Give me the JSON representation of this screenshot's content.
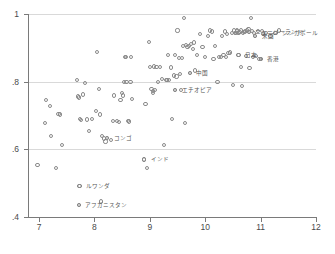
{
  "chart_data": {
    "type": "scatter",
    "title": "",
    "subtitle": "",
    "xlabel": "",
    "ylabel": "",
    "xlim": [
      6.8,
      12.0
    ],
    "ylim": [
      0.4,
      1.0
    ],
    "grid": true,
    "gridlines_y": [
      0.4,
      0.6,
      0.8,
      1.0
    ],
    "legend": "none",
    "marker": "open-circle",
    "marker_color": "#8a8a8a",
    "x_ticks": [
      "7",
      "8",
      "9",
      "10",
      "11",
      "12"
    ],
    "x_tick_values": [
      7,
      8,
      9,
      10,
      11,
      12
    ],
    "y_ticks": [
      "1",
      ".8",
      ".6",
      ".4"
    ],
    "y_tick_values": [
      1.0,
      0.8,
      0.6,
      0.4
    ],
    "labeled_points": [
      {
        "label": "シンガポール",
        "x": 11.27,
        "y": 0.945,
        "anchor": "right"
      },
      {
        "label": "米国",
        "x": 10.9,
        "y": 0.935,
        "anchor": "right"
      },
      {
        "label": "ニュージーランド",
        "x": 10.79,
        "y": 0.946,
        "anchor": "right"
      },
      {
        "label": "日本",
        "x": 10.6,
        "y": 0.88,
        "anchor": "right"
      },
      {
        "label": "香港",
        "x": 11.0,
        "y": 0.866,
        "anchor": "right"
      },
      {
        "label": "中国",
        "x": 9.72,
        "y": 0.826,
        "anchor": "right"
      },
      {
        "label": "エチオピア",
        "x": 9.46,
        "y": 0.776,
        "anchor": "right"
      },
      {
        "label": "コンゴ",
        "x": 8.23,
        "y": 0.633,
        "anchor": "right"
      },
      {
        "label": "インド",
        "x": 8.9,
        "y": 0.57,
        "anchor": "right"
      },
      {
        "label": "ルワンダ",
        "x": 7.73,
        "y": 0.492,
        "anchor": "right"
      },
      {
        "label": "アフガニスタン",
        "x": 7.72,
        "y": 0.436,
        "anchor": "right"
      }
    ],
    "points": [
      [
        6.97,
        0.553
      ],
      [
        7.1,
        0.678
      ],
      [
        7.12,
        0.745
      ],
      [
        7.2,
        0.728
      ],
      [
        7.22,
        0.639
      ],
      [
        7.3,
        0.545
      ],
      [
        7.35,
        0.705
      ],
      [
        7.38,
        0.703
      ],
      [
        7.41,
        0.612
      ],
      [
        7.68,
        0.806
      ],
      [
        7.7,
        0.756
      ],
      [
        7.72,
        0.753
      ],
      [
        7.73,
        0.492
      ],
      [
        7.72,
        0.436
      ],
      [
        7.74,
        0.69
      ],
      [
        7.76,
        0.686
      ],
      [
        7.8,
        0.762
      ],
      [
        7.83,
        0.795
      ],
      [
        7.86,
        0.688
      ],
      [
        7.9,
        0.655
      ],
      [
        7.95,
        0.69
      ],
      [
        8.03,
        0.713
      ],
      [
        8.05,
        0.888
      ],
      [
        8.08,
        0.778
      ],
      [
        8.1,
        0.703
      ],
      [
        8.12,
        0.446
      ],
      [
        8.14,
        0.64
      ],
      [
        8.17,
        0.632
      ],
      [
        8.2,
        0.623
      ],
      [
        8.23,
        0.633
      ],
      [
        8.3,
        0.627
      ],
      [
        8.33,
        0.684
      ],
      [
        8.36,
        0.759
      ],
      [
        8.4,
        0.683
      ],
      [
        8.44,
        0.68
      ],
      [
        8.47,
        0.746
      ],
      [
        8.49,
        0.766
      ],
      [
        8.52,
        0.759
      ],
      [
        8.54,
        0.8
      ],
      [
        8.55,
        0.872
      ],
      [
        8.57,
        0.872
      ],
      [
        8.58,
        0.799
      ],
      [
        8.6,
        0.684
      ],
      [
        8.63,
        0.682
      ],
      [
        8.65,
        0.8
      ],
      [
        8.66,
        0.874
      ],
      [
        8.68,
        0.749
      ],
      [
        8.9,
        0.57
      ],
      [
        8.92,
        0.733
      ],
      [
        8.95,
        0.545
      ],
      [
        8.98,
        0.918
      ],
      [
        9.0,
        0.843
      ],
      [
        9.03,
        0.778
      ],
      [
        9.05,
        0.766
      ],
      [
        9.06,
        0.773
      ],
      [
        9.08,
        0.845
      ],
      [
        9.1,
        0.776
      ],
      [
        9.12,
        0.844
      ],
      [
        9.15,
        0.8
      ],
      [
        9.18,
        0.843
      ],
      [
        9.22,
        0.808
      ],
      [
        9.26,
        0.612
      ],
      [
        9.3,
        0.805
      ],
      [
        9.31,
        0.806
      ],
      [
        9.33,
        0.88
      ],
      [
        9.35,
        0.804
      ],
      [
        9.38,
        0.842
      ],
      [
        9.4,
        0.69
      ],
      [
        9.43,
        0.818
      ],
      [
        9.45,
        0.88
      ],
      [
        9.46,
        0.776
      ],
      [
        9.48,
        0.815
      ],
      [
        9.5,
        0.951
      ],
      [
        9.52,
        0.871
      ],
      [
        9.54,
        0.823
      ],
      [
        9.56,
        0.776
      ],
      [
        9.58,
        0.87
      ],
      [
        9.6,
        0.905
      ],
      [
        9.62,
        0.988
      ],
      [
        9.64,
        0.678
      ],
      [
        9.66,
        0.908
      ],
      [
        9.68,
        0.903
      ],
      [
        9.7,
        0.905
      ],
      [
        9.72,
        0.826
      ],
      [
        9.75,
        0.912
      ],
      [
        9.78,
        0.896
      ],
      [
        9.8,
        0.916
      ],
      [
        9.82,
        0.833
      ],
      [
        9.85,
        0.878
      ],
      [
        9.9,
        0.942
      ],
      [
        9.95,
        0.903
      ],
      [
        10.0,
        0.873
      ],
      [
        10.05,
        0.936
      ],
      [
        10.08,
        0.951
      ],
      [
        10.12,
        0.948
      ],
      [
        10.15,
        0.866
      ],
      [
        10.18,
        0.905
      ],
      [
        10.22,
        0.798
      ],
      [
        10.25,
        0.873
      ],
      [
        10.28,
        0.873
      ],
      [
        10.3,
        0.936
      ],
      [
        10.33,
        0.88
      ],
      [
        10.35,
        0.948
      ],
      [
        10.38,
        0.873
      ],
      [
        10.4,
        0.941
      ],
      [
        10.42,
        0.885
      ],
      [
        10.45,
        0.886
      ],
      [
        10.48,
        0.944
      ],
      [
        10.5,
        0.79
      ],
      [
        10.52,
        0.951
      ],
      [
        10.54,
        0.945
      ],
      [
        10.56,
        0.945
      ],
      [
        10.57,
        0.948
      ],
      [
        10.58,
        0.951
      ],
      [
        10.6,
        0.88
      ],
      [
        10.6,
        0.944
      ],
      [
        10.62,
        0.947
      ],
      [
        10.64,
        0.843
      ],
      [
        10.65,
        0.951
      ],
      [
        10.66,
        0.788
      ],
      [
        10.68,
        0.944
      ],
      [
        10.7,
        0.946
      ],
      [
        10.72,
        0.948
      ],
      [
        10.74,
        0.875
      ],
      [
        10.76,
        0.951
      ],
      [
        10.78,
        0.955
      ],
      [
        10.79,
        0.946
      ],
      [
        10.8,
        0.84
      ],
      [
        10.82,
        0.988
      ],
      [
        10.84,
        0.95
      ],
      [
        10.86,
        0.873
      ],
      [
        10.88,
        0.944
      ],
      [
        10.9,
        0.935
      ],
      [
        10.92,
        0.876
      ],
      [
        10.95,
        0.949
      ],
      [
        10.98,
        0.866
      ],
      [
        11.0,
        0.866
      ],
      [
        11.02,
        0.95
      ],
      [
        11.05,
        0.942
      ],
      [
        11.1,
        0.944
      ],
      [
        11.18,
        0.936
      ],
      [
        11.27,
        0.945
      ],
      [
        11.33,
        0.951
      ]
    ]
  }
}
